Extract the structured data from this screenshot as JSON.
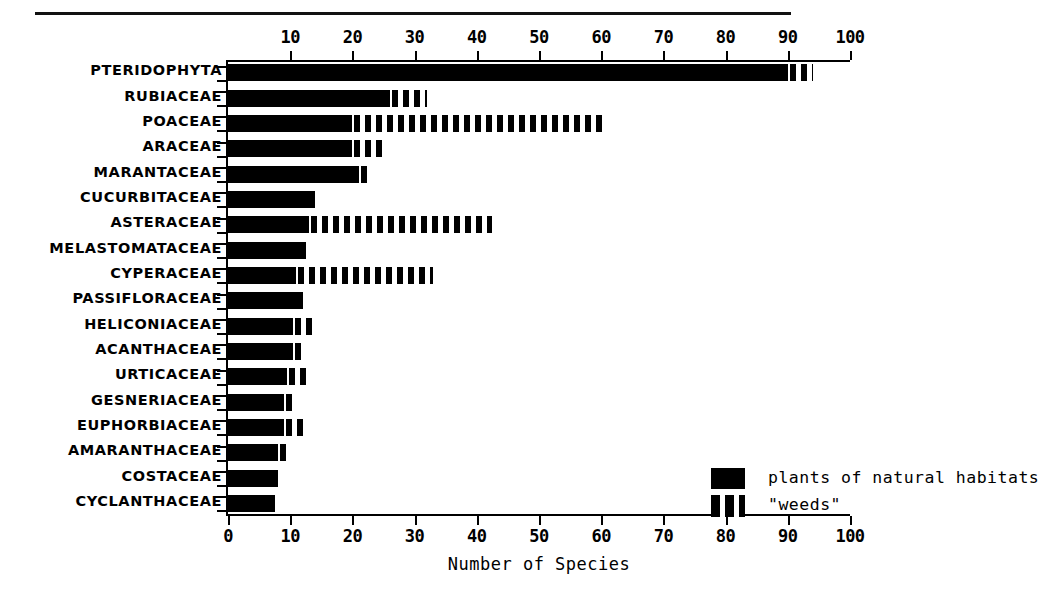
{
  "figure": {
    "has_top_rule": true,
    "background": "#ffffff",
    "ink": "#000000"
  },
  "legend": {
    "position": "inside-right-middle",
    "entries": [
      {
        "key": "solid",
        "label": "plants of natural habitats"
      },
      {
        "key": "dashed",
        "label": "\"weeds\""
      }
    ]
  },
  "chart_data": {
    "type": "bar",
    "orientation": "horizontal",
    "stacked": true,
    "title": "",
    "subtitle": "",
    "xlabel": "Number of Species",
    "ylabel": "",
    "xlim": [
      0,
      100
    ],
    "grid": false,
    "legend_position": "inside-right-middle",
    "axis_top_ticks": [
      10,
      20,
      30,
      40,
      50,
      60,
      70,
      80,
      90,
      100
    ],
    "axis_bottom_ticks": [
      0,
      10,
      20,
      30,
      40,
      50,
      60,
      70,
      80,
      90,
      100
    ],
    "categories": [
      "PTERIDOPHYTA",
      "RUBIACEAE",
      "POACEAE",
      "ARACEAE",
      "MARANTACEAE",
      "CUCURBITACEAE",
      "ASTERACEAE",
      "MELASTOMATACEAE",
      "CYPERACEAE",
      "PASSIFLORACEAE",
      "HELICONIACEAE",
      "ACANTHACEAE",
      "URTICACEAE",
      "GESNERIACEAE",
      "EUPHORBIACEAE",
      "AMARANTHACEAE",
      "COSTACEAE",
      "CYCLANTHACEAE"
    ],
    "series": [
      {
        "name": "plants of natural habitats",
        "style": "solid",
        "values": [
          90,
          26,
          20,
          20,
          21,
          14,
          13,
          12.5,
          11,
          12,
          10.5,
          10.5,
          9.5,
          9,
          9,
          8,
          8,
          7.5
        ]
      },
      {
        "name": "\"weeds\"",
        "style": "dashed",
        "values": [
          4,
          6,
          41,
          5,
          1.5,
          0,
          29.5,
          0,
          22,
          0,
          3,
          2,
          3,
          2,
          3.5,
          2,
          0,
          0
        ]
      }
    ],
    "totals": [
      94,
      32,
      61,
      25,
      22.5,
      14,
      42.5,
      12.5,
      33,
      12,
      13.5,
      12.5,
      12.5,
      11,
      12.5,
      10,
      8,
      7.5
    ]
  }
}
